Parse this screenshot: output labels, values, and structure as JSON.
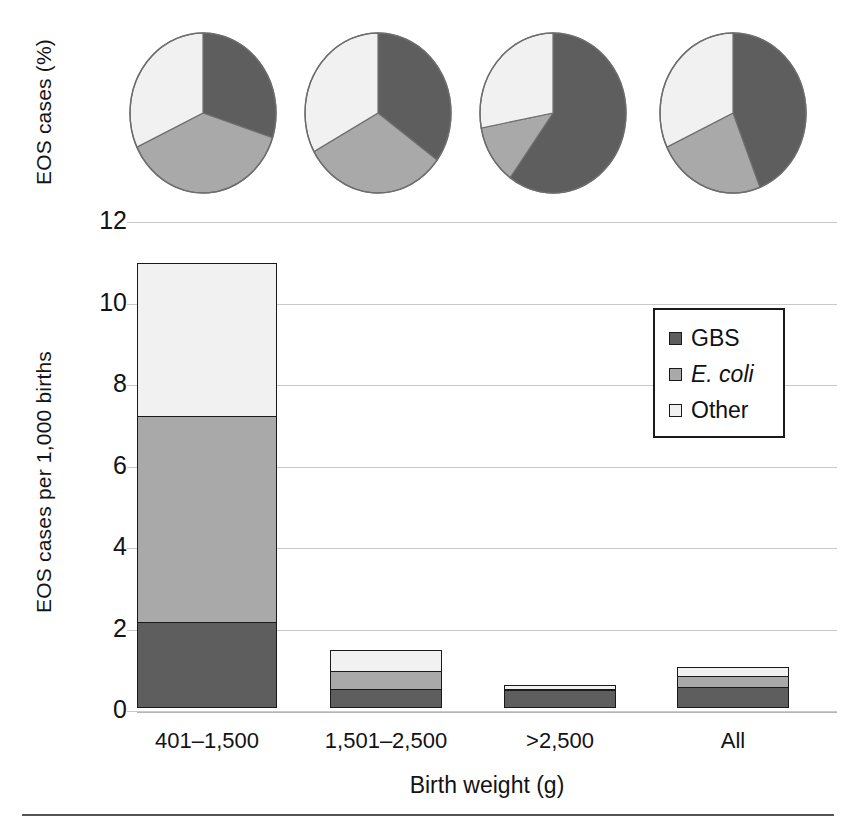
{
  "chart_data": [
    {
      "type": "pie",
      "title": "EOS pathogen distribution by birth weight",
      "ylabel": "EOS cases (%)",
      "legend": [
        "GBS",
        "E. coli",
        "Other"
      ],
      "panels": [
        {
          "category": "401-1,500",
          "labels": [
            "GBS",
            "E. coli",
            "Other"
          ],
          "values": [
            30,
            38,
            32
          ]
        },
        {
          "category": "1,501-2,500",
          "labels": [
            "GBS",
            "E. coli",
            "Other"
          ],
          "values": [
            35,
            32,
            33
          ]
        },
        {
          "category": ">2,500",
          "labels": [
            "GBS",
            "E. coli",
            "Other"
          ],
          "values": [
            60,
            12,
            28
          ]
        },
        {
          "category": "All",
          "labels": [
            "GBS",
            "E. coli",
            "Other"
          ],
          "values": [
            44,
            24,
            32
          ]
        }
      ]
    },
    {
      "type": "bar",
      "subtype": "stacked",
      "title": "",
      "xlabel": "Birth weight (g)",
      "ylabel": "EOS cases per 1,000 births",
      "categories": [
        "401–1,500",
        "1,501–2,500",
        ">2,500",
        "All"
      ],
      "ylim": [
        0,
        12
      ],
      "yticks": [
        "0",
        "2",
        "4",
        "6",
        "8",
        "10",
        "12"
      ],
      "grid": true,
      "legend_position": "upper-right",
      "series": [
        {
          "name": "GBS",
          "color": "#5e5e5e",
          "values": [
            2.1,
            0.45,
            0.43,
            0.52
          ]
        },
        {
          "name": "E. coli",
          "color": "#a9a9a9",
          "values": [
            5.1,
            0.5,
            0.06,
            0.3
          ]
        },
        {
          "name": "Other",
          "color": "#f1f1f1",
          "values": [
            3.8,
            0.55,
            0.14,
            0.26
          ]
        }
      ],
      "totals": [
        11.0,
        1.5,
        0.63,
        1.08
      ]
    }
  ],
  "axes": {
    "pie_axis_title": "EOS cases (%)",
    "bar_axis_title": "EOS cases per 1,000 births",
    "x_axis_title": "Birth weight (g)",
    "y_ticks": [
      "12",
      "10",
      "8",
      "6",
      "4",
      "2",
      "0"
    ],
    "x_ticks": [
      "401–1,500",
      "1,501–2,500",
      ">2,500",
      "All"
    ]
  },
  "legend": {
    "items": [
      {
        "label": "GBS",
        "color": "#5e5e5e",
        "italic": false
      },
      {
        "label": "E. coli",
        "color": "#a9a9a9",
        "italic": true
      },
      {
        "label": "Other",
        "color": "#f1f1f1",
        "italic": false
      }
    ]
  },
  "colors": {
    "gbs": "#5e5e5e",
    "ecoli": "#a9a9a9",
    "other": "#f1f1f1",
    "outline": "#1a1a1a",
    "grid": "#c9c9c9",
    "text": "#131313"
  }
}
